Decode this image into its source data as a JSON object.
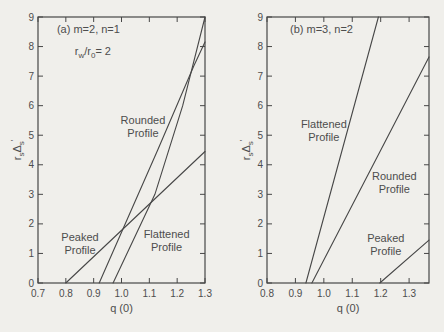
{
  "figure": {
    "background": "#f0efeb",
    "ink": "#474747",
    "text_color": "#4d4d4d"
  },
  "chart_data": [
    {
      "id": "panel-a",
      "type": "line",
      "grid": false,
      "framed": true,
      "title_lines": [
        {
          "pos": [
            0.768,
            8.45
          ],
          "segments": [
            [
              "(a) m=2, n=1",
              ""
            ]
          ]
        },
        {
          "pos": [
            0.832,
            7.72
          ],
          "segments": [
            [
              "r",
              ""
            ],
            [
              "w",
              "sub"
            ],
            [
              "/r",
              ""
            ],
            [
              "0",
              "sub"
            ],
            [
              "= 2",
              ""
            ]
          ]
        }
      ],
      "xlabel": "q (0)",
      "ylabel_segments": [
        [
          "r",
          ""
        ],
        [
          "s",
          "sub"
        ],
        [
          "Δ",
          ""
        ],
        [
          "s",
          "sub"
        ],
        [
          "′",
          "sup"
        ]
      ],
      "xlim": [
        0.7,
        1.3
      ],
      "ylim": [
        0,
        9
      ],
      "xticks": [
        0.7,
        0.8,
        0.9,
        1.0,
        1.1,
        1.2,
        1.3
      ],
      "xtick_labels": [
        "0.7",
        "0.8",
        "0.9",
        "1.0",
        "1.1",
        "1.2",
        "1.3"
      ],
      "yticks": [
        0,
        1,
        2,
        3,
        4,
        5,
        6,
        7,
        8,
        9
      ],
      "ytick_labels": [
        "0",
        "1",
        "2",
        "3",
        "4",
        "5",
        "6",
        "7",
        "8",
        "9"
      ],
      "series": [
        {
          "name": "Peaked Profile",
          "points": [
            [
              0.8,
              0
            ],
            [
              1.3,
              4.45
            ]
          ],
          "label_lines": [
            "Peaked",
            "Profile"
          ],
          "label_pos": [
            0.851,
            1.35
          ]
        },
        {
          "name": "Rounded Profile",
          "points": [
            [
              0.92,
              0
            ],
            [
              1.13,
              4.5
            ],
            [
              1.26,
              7.35
            ],
            [
              1.3,
              8.15
            ]
          ],
          "label_lines": [
            "Rounded",
            "Profile"
          ],
          "label_pos": [
            1.077,
            5.3
          ]
        },
        {
          "name": "Flattened Profile",
          "points": [
            [
              0.97,
              0
            ],
            [
              1.12,
              3.0
            ],
            [
              1.22,
              6.0
            ],
            [
              1.3,
              9.0
            ]
          ],
          "label_lines": [
            "Flattened",
            "Profile"
          ],
          "label_pos": [
            1.162,
            1.45
          ]
        }
      ]
    },
    {
      "id": "panel-b",
      "type": "line",
      "grid": false,
      "framed": true,
      "title_lines": [
        {
          "pos": [
            0.881,
            8.45
          ],
          "segments": [
            [
              "(b) m=3, n=2",
              ""
            ]
          ]
        }
      ],
      "xlabel": "q (0)",
      "ylabel_segments": [
        [
          "r",
          ""
        ],
        [
          "s",
          "sub"
        ],
        [
          "Δ",
          ""
        ],
        [
          "s",
          "sub"
        ],
        [
          "′",
          "sup"
        ]
      ],
      "xlim": [
        0.8,
        1.37
      ],
      "ylim": [
        0,
        9
      ],
      "xticks": [
        0.8,
        0.9,
        1.0,
        1.1,
        1.2,
        1.3
      ],
      "xtick_labels": [
        "0.8",
        "0.9",
        "1.0",
        "1.1",
        "1.2",
        "1.3"
      ],
      "yticks": [
        0,
        1,
        2,
        3,
        4,
        5,
        6,
        7,
        8,
        9
      ],
      "ytick_labels": [
        "0",
        "1",
        "2",
        "3",
        "4",
        "5",
        "6",
        "7",
        "8",
        "9"
      ],
      "series": [
        {
          "name": "Flattened Profile",
          "points": [
            [
              0.937,
              0
            ],
            [
              1.192,
              9.0
            ]
          ],
          "label_lines": [
            "Flattened",
            "Profile"
          ],
          "label_pos": [
            1.0,
            5.15
          ]
        },
        {
          "name": "Rounded Profile",
          "points": [
            [
              0.958,
              0
            ],
            [
              1.37,
              7.65
            ]
          ],
          "label_lines": [
            "Rounded",
            "Profile"
          ],
          "label_pos": [
            1.248,
            3.4
          ]
        },
        {
          "name": "Peaked Profile",
          "points": [
            [
              1.197,
              0
            ],
            [
              1.37,
              1.45
            ]
          ],
          "label_lines": [
            "Peaked",
            "Profile"
          ],
          "label_pos": [
            1.218,
            1.3
          ]
        }
      ]
    }
  ]
}
